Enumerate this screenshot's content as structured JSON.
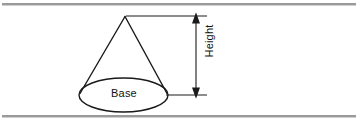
{
  "figure": {
    "type": "geometry-diagram",
    "shape": "cone",
    "labels": {
      "base": "Base",
      "height": "Height"
    },
    "colors": {
      "outline": "#1a1a1a",
      "dimension_line": "#1a1a1a",
      "rule": "#9a9a9a",
      "background": "#ffffff",
      "text": "#111111"
    },
    "geometry": {
      "apex": [
        125,
        16
      ],
      "base_center": [
        123.5,
        95
      ],
      "base_rx": 44.5,
      "base_ry": 17,
      "dimension_line_x": 196,
      "dimension_top_y": 16,
      "dimension_bottom_y": 95
    },
    "rules": {
      "top_y": 3,
      "bottom_y": 115
    }
  }
}
